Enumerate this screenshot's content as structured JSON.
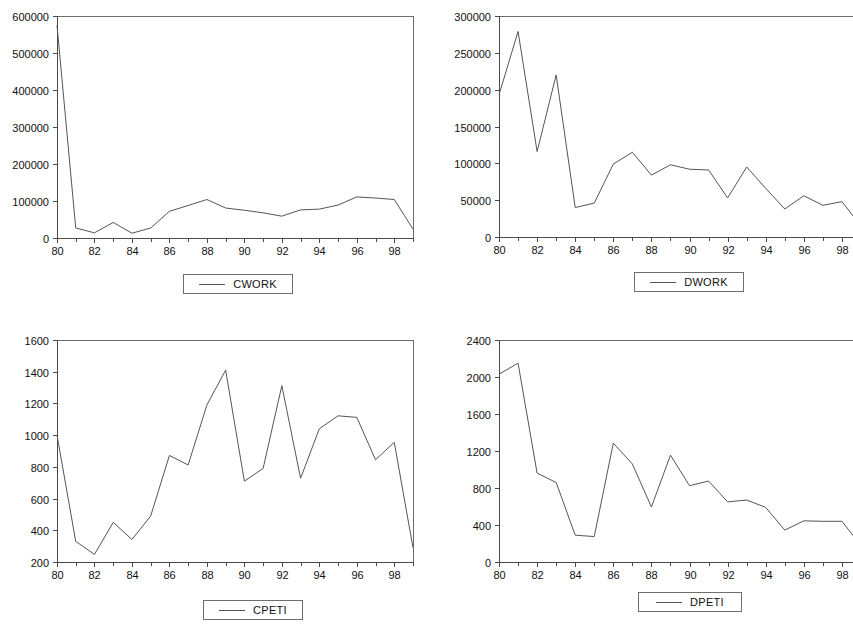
{
  "figure": {
    "panel_count": 4,
    "background": "#ffffff",
    "line_color": "#555555",
    "axis_color": "#4a4a4a"
  },
  "chart_data": [
    {
      "type": "line",
      "title": "",
      "panel": "top-left",
      "xlabel": "",
      "ylabel": "",
      "legend": "CWORK",
      "legend_position": "below-center",
      "grid": false,
      "xlim": [
        80,
        99
      ],
      "ylim": [
        0,
        600000
      ],
      "yticks": [
        0,
        100000,
        200000,
        300000,
        400000,
        500000,
        600000
      ],
      "ytick_labels": [
        "0",
        "100000",
        "200000",
        "300000",
        "400000",
        "500000",
        "600000"
      ],
      "xticks": [
        80,
        82,
        84,
        86,
        88,
        90,
        92,
        94,
        96,
        98
      ],
      "xtick_labels": [
        "80",
        "82",
        "84",
        "86",
        "88",
        "90",
        "92",
        "94",
        "96",
        "98"
      ],
      "x": [
        80,
        81,
        82,
        83,
        84,
        85,
        86,
        87,
        88,
        89,
        90,
        91,
        92,
        93,
        94,
        95,
        96,
        97,
        98,
        99
      ],
      "series": [
        {
          "name": "CWORK",
          "values": [
            575000,
            27000,
            14000,
            42000,
            13000,
            27000,
            72000,
            88000,
            104000,
            81000,
            75000,
            68000,
            59000,
            76000,
            78000,
            89000,
            111000,
            108000,
            104000,
            24000
          ]
        }
      ]
    },
    {
      "type": "line",
      "title": "",
      "panel": "top-right",
      "xlabel": "",
      "ylabel": "",
      "legend": "DWORK",
      "legend_position": "below-center",
      "grid": false,
      "xlim": [
        80,
        99
      ],
      "ylim": [
        0,
        300000
      ],
      "yticks": [
        0,
        50000,
        100000,
        150000,
        200000,
        250000,
        300000
      ],
      "ytick_labels": [
        "0",
        "50000",
        "100000",
        "150000",
        "200000",
        "250000",
        "300000"
      ],
      "xticks": [
        80,
        82,
        84,
        86,
        88,
        90,
        92,
        94,
        96,
        98
      ],
      "xtick_labels": [
        "80",
        "82",
        "84",
        "86",
        "88",
        "90",
        "92",
        "94",
        "96",
        "98"
      ],
      "x": [
        80,
        81,
        82,
        83,
        84,
        85,
        86,
        87,
        88,
        89,
        90,
        91,
        92,
        93,
        94,
        95,
        96,
        97,
        98,
        99
      ],
      "series": [
        {
          "name": "DWORK",
          "values": [
            193000,
            279000,
            116000,
            220000,
            40000,
            46000,
            99000,
            115000,
            84000,
            98000,
            92000,
            91000,
            53000,
            95000,
            66000,
            38000,
            56000,
            43000,
            48000,
            15000
          ]
        }
      ]
    },
    {
      "type": "line",
      "title": "",
      "panel": "bottom-left",
      "xlabel": "",
      "ylabel": "",
      "legend": "CPETI",
      "legend_position": "below-center",
      "grid": false,
      "xlim": [
        80,
        99
      ],
      "ylim": [
        200,
        1600
      ],
      "yticks": [
        200,
        400,
        600,
        800,
        1000,
        1200,
        1400,
        1600
      ],
      "ytick_labels": [
        "200",
        "400",
        "600",
        "800",
        "1000",
        "1200",
        "1400",
        "1600"
      ],
      "xticks": [
        80,
        82,
        84,
        86,
        88,
        90,
        92,
        94,
        96,
        98
      ],
      "xtick_labels": [
        "80",
        "82",
        "84",
        "86",
        "88",
        "90",
        "92",
        "94",
        "96",
        "98"
      ],
      "x": [
        80,
        81,
        82,
        83,
        84,
        85,
        86,
        87,
        88,
        89,
        90,
        91,
        92,
        93,
        94,
        95,
        96,
        97,
        98,
        99
      ],
      "series": [
        {
          "name": "CPETI",
          "values": [
            1000,
            330,
            248,
            450,
            342,
            490,
            872,
            812,
            1190,
            1410,
            710,
            790,
            1312,
            728,
            1040,
            1122,
            1112,
            845,
            955,
            290
          ]
        }
      ]
    },
    {
      "type": "line",
      "title": "",
      "panel": "bottom-right",
      "xlabel": "",
      "ylabel": "",
      "legend": "DPETI",
      "legend_position": "below-center",
      "grid": false,
      "xlim": [
        80,
        99
      ],
      "ylim": [
        0,
        2400
      ],
      "yticks": [
        0,
        400,
        800,
        1200,
        1600,
        2000,
        2400
      ],
      "ytick_labels": [
        "0",
        "400",
        "800",
        "1200",
        "1600",
        "2000",
        "2400"
      ],
      "xticks": [
        80,
        82,
        84,
        86,
        88,
        90,
        92,
        94,
        96,
        98
      ],
      "xtick_labels": [
        "80",
        "82",
        "84",
        "86",
        "88",
        "90",
        "92",
        "94",
        "96",
        "98"
      ],
      "x": [
        80,
        81,
        82,
        83,
        84,
        85,
        86,
        87,
        88,
        89,
        90,
        91,
        92,
        93,
        94,
        95,
        96,
        97,
        98,
        99
      ],
      "series": [
        {
          "name": "DPETI",
          "values": [
            2030,
            2150,
            960,
            860,
            290,
            275,
            1285,
            1060,
            595,
            1155,
            825,
            875,
            650,
            670,
            590,
            345,
            445,
            440,
            440,
            175
          ]
        }
      ]
    }
  ],
  "legends": {
    "top_left": "CWORK",
    "top_right": "DWORK",
    "bottom_left": "CPETI",
    "bottom_right": "DPETI"
  }
}
